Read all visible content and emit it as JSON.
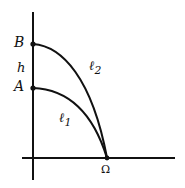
{
  "figure": {
    "background_color": "#ffffff",
    "stroke_color": "#111111",
    "axes": {
      "x_axis": {
        "name": "horizontal-axis",
        "x1": 22,
        "y1": 158,
        "x2": 175,
        "y2": 158
      },
      "y_axis": {
        "name": "vertical-axis",
        "x1": 33,
        "y1": 12,
        "x2": 33,
        "y2": 180
      }
    },
    "points": [
      {
        "id": "B",
        "label": "B",
        "x": 33,
        "y": 44,
        "marker": "dot"
      },
      {
        "id": "A",
        "label": "A",
        "x": 33,
        "y": 88,
        "marker": "dot"
      },
      {
        "id": "Omega",
        "label": "Ω",
        "x": 107,
        "y": 158,
        "marker": "dot"
      }
    ],
    "segments": [
      {
        "id": "h",
        "label": "h",
        "from": "A",
        "to": "B",
        "description": "vertical gap between A and B on the y-axis"
      }
    ],
    "curves": [
      {
        "id": "l2",
        "label": "ℓ2",
        "label_text": "ℓ",
        "label_sub": "2",
        "from": "B",
        "to": "Omega",
        "path": "M 33 44 C 62 46, 92 78, 107 158",
        "label_x": 89,
        "label_y": 59
      },
      {
        "id": "l1",
        "label": "ℓ1",
        "label_text": "ℓ",
        "label_sub": "1",
        "from": "A",
        "to": "Omega",
        "path": "M 33 88 C 60 89, 90 103, 107 158",
        "label_x": 59,
        "label_y": 111
      }
    ],
    "labels": {
      "B": "B",
      "A": "A",
      "h": "h",
      "omega": "Ω",
      "l1_base": "ℓ",
      "l1_sub": "1",
      "l2_base": "ℓ",
      "l2_sub": "2"
    }
  }
}
